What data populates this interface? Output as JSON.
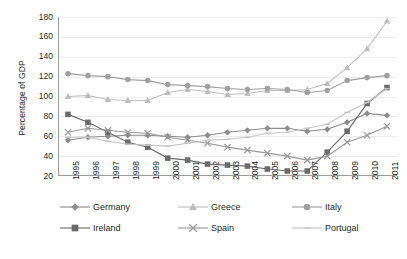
{
  "chart_data": {
    "type": "line",
    "title": "",
    "xlabel": "",
    "ylabel": "Percentage of GDP",
    "ylim": [
      20,
      180
    ],
    "yticks": [
      20,
      40,
      60,
      80,
      100,
      120,
      140,
      160,
      180
    ],
    "grid": true,
    "legend_position": "bottom",
    "categories": [
      "1995",
      "1996",
      "1997",
      "1998",
      "1999",
      "2000",
      "2001",
      "2002",
      "2003",
      "2004",
      "2005",
      "2006",
      "2007",
      "2008",
      "2009",
      "2010",
      "2011"
    ],
    "series": [
      {
        "name": "Germany",
        "marker": "diamond",
        "color": "#8c8c8c",
        "values": [
          56,
          59,
          60,
          61,
          61,
          60,
          59,
          61,
          64,
          66,
          68,
          68,
          65,
          67,
          74,
          83,
          81
        ]
      },
      {
        "name": "Greece",
        "marker": "triangle",
        "color": "#bdbdbd",
        "values": [
          100,
          101,
          97,
          96,
          96,
          104,
          107,
          105,
          102,
          103,
          106,
          106,
          107,
          113,
          129,
          148,
          176
        ]
      },
      {
        "name": "Italy",
        "marker": "circle",
        "color": "#a0a0a0",
        "values": [
          123,
          121,
          120,
          117,
          116,
          112,
          111,
          110,
          108,
          107,
          108,
          107,
          104,
          106,
          116,
          119,
          121
        ]
      },
      {
        "name": "Ireland",
        "marker": "square",
        "color": "#6b6b6b",
        "values": [
          82,
          74,
          64,
          54,
          49,
          38,
          36,
          32,
          31,
          30,
          27,
          25,
          25,
          44,
          65,
          93,
          109
        ]
      },
      {
        "name": "Spain",
        "marker": "cross",
        "color": "#9a9a9a",
        "values": [
          64,
          68,
          66,
          64,
          63,
          59,
          56,
          53,
          49,
          46,
          43,
          40,
          36,
          40,
          54,
          61,
          70
        ]
      },
      {
        "name": "Portugal",
        "marker": "line",
        "color": "#c4c4c4",
        "values": [
          59,
          59,
          55,
          52,
          51,
          50,
          53,
          56,
          57,
          59,
          63,
          64,
          68,
          72,
          84,
          94,
          108
        ]
      }
    ]
  },
  "legend": {
    "items": [
      {
        "label": "Germany"
      },
      {
        "label": "Greece"
      },
      {
        "label": "Italy"
      },
      {
        "label": "Ireland"
      },
      {
        "label": "Spain"
      },
      {
        "label": "Portugal"
      }
    ]
  }
}
